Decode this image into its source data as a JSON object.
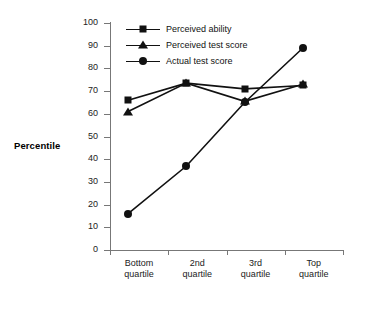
{
  "chart_data": {
    "type": "line",
    "title": "",
    "xlabel": "",
    "ylabel": "Percentile",
    "ylim": [
      0,
      100
    ],
    "ytick_step": 10,
    "yticks": [
      0,
      10,
      20,
      30,
      40,
      50,
      60,
      70,
      80,
      90,
      100
    ],
    "grid": false,
    "legend_position": "top-left-inside",
    "categories": [
      "Bottom quartile",
      "2nd quartile",
      "3rd quartile",
      "Top quartile"
    ],
    "categories_lines": [
      [
        "Bottom",
        "quartile"
      ],
      [
        "2nd",
        "quartile"
      ],
      [
        "3rd",
        "quartile"
      ],
      [
        "Top",
        "quartile"
      ]
    ],
    "series": [
      {
        "name": "Perceived ability",
        "marker": "square",
        "color": "#111111",
        "values": [
          66,
          73.5,
          71,
          72.5
        ]
      },
      {
        "name": "Perceived test score",
        "marker": "triangle",
        "color": "#111111",
        "values": [
          61,
          73.5,
          65.5,
          73
        ]
      },
      {
        "name": "Actual test score",
        "marker": "circle",
        "color": "#111111",
        "values": [
          16,
          37,
          65,
          89
        ]
      }
    ]
  },
  "axis": {
    "y_title": "Percentile"
  },
  "legend": {
    "items": [
      {
        "label": "Perceived ability",
        "marker": "square-marker-icon"
      },
      {
        "label": "Perceived test score",
        "marker": "triangle-marker-icon"
      },
      {
        "label": "Actual test score",
        "marker": "circle-marker-icon"
      }
    ]
  },
  "colors": {
    "ink": "#111111",
    "axis": "#777777",
    "background": "#ffffff"
  }
}
